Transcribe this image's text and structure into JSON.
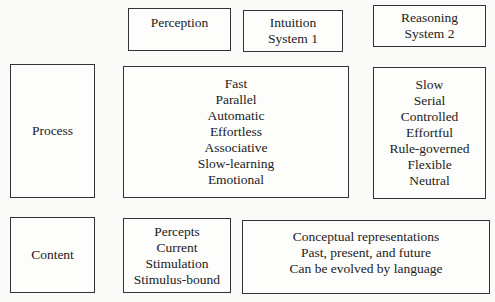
{
  "headers": {
    "perception": [
      "Perception"
    ],
    "intuition": [
      "Intuition",
      "System 1"
    ],
    "reasoning": [
      "Reasoning",
      "System 2"
    ]
  },
  "rows": {
    "process": {
      "label": "Process",
      "intuition_perception": [
        "Fast",
        "Parallel",
        "Automatic",
        "Effortless",
        "Associative",
        "Slow-learning",
        "Emotional"
      ],
      "reasoning": [
        "Slow",
        "Serial",
        "Controlled",
        "Effortful",
        "Rule-governed",
        "Flexible",
        "Neutral"
      ]
    },
    "content": {
      "label": "Content",
      "perception": [
        "Percepts",
        "Current",
        "Stimulation",
        "Stimulus-bound"
      ],
      "intuition_reasoning": [
        "Conceptual representations",
        "Past, present, and future",
        "Can be evolved by language"
      ]
    }
  }
}
